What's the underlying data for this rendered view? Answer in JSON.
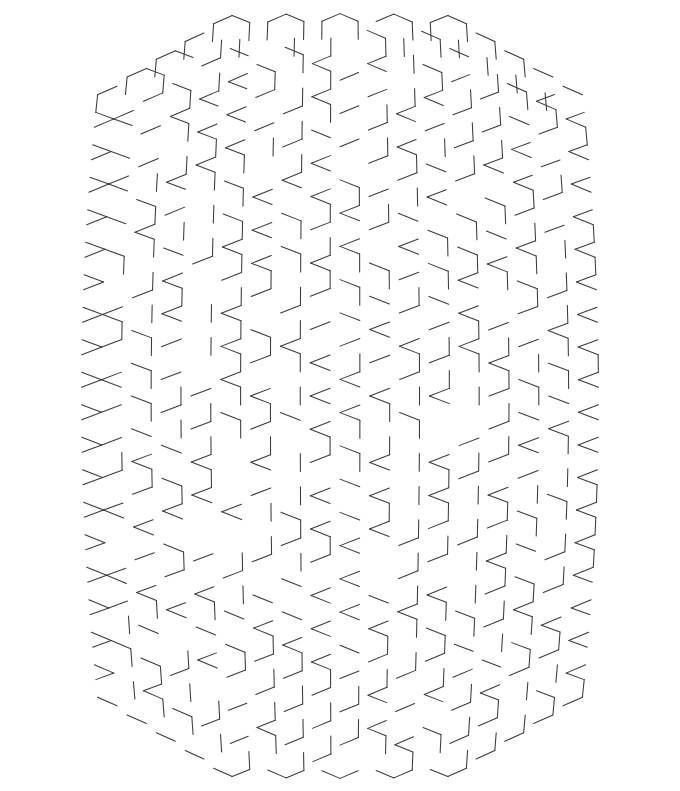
{
  "page": {
    "kind": "maze",
    "width": 680,
    "height": 791,
    "background_color": "#ffffff"
  },
  "maze": {
    "name": "hexagonal-barrel-maze",
    "grid_type": "hexagonal",
    "hex_orientation": "pointy-top",
    "wall_color": "#3a3a42",
    "wall_width": 1.05,
    "cell_width": 36,
    "cell_height": 32,
    "columns": 17,
    "rows": 25,
    "outline_shape": "barrel",
    "bounds": {
      "left": 40,
      "top": 30,
      "right": 641,
      "bottom": 762
    },
    "entrance": {
      "label": "entrance",
      "position": "top-center",
      "x": 362,
      "y": 39,
      "gap_width": 20
    },
    "exit": {
      "label": "exit",
      "position": "bottom-center",
      "x": 363,
      "y": 752,
      "gap_width": 20
    },
    "geometry": {
      "center_x": 340,
      "center_y": 396,
      "half_width": 300,
      "half_height": 366,
      "side_bulge": 0.055,
      "cap_sag": 34,
      "seed": 20483,
      "wall_density": 0.47
    }
  }
}
